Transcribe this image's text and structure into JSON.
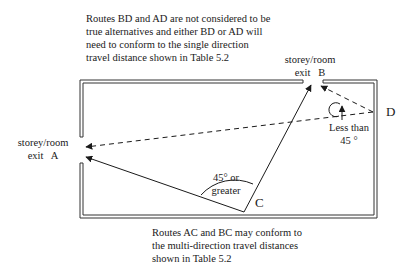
{
  "top_note": {
    "lines": [
      "Routes BD and AD are not considered to be",
      "true alternatives and either BD or AD will",
      "need to conform to the single direction",
      "travel distance shown in Table 5.2"
    ]
  },
  "bottom_note": {
    "lines": [
      "Routes AC and BC may conform to",
      "the multi-direction travel distances",
      "shown in Table 5.2"
    ]
  },
  "exit_a": {
    "line1": "storey/room",
    "line2": "exit   A"
  },
  "exit_b": {
    "line1": "storey/room",
    "line2": "exit   B"
  },
  "points": {
    "c": "C",
    "d": "D"
  },
  "angle_large": {
    "line1": "45° or",
    "line2": "greater"
  },
  "angle_small": {
    "line1": "Less than",
    "line2": "45 °"
  },
  "colors": {
    "line": "#1a1a1a",
    "wall": "#333333"
  }
}
